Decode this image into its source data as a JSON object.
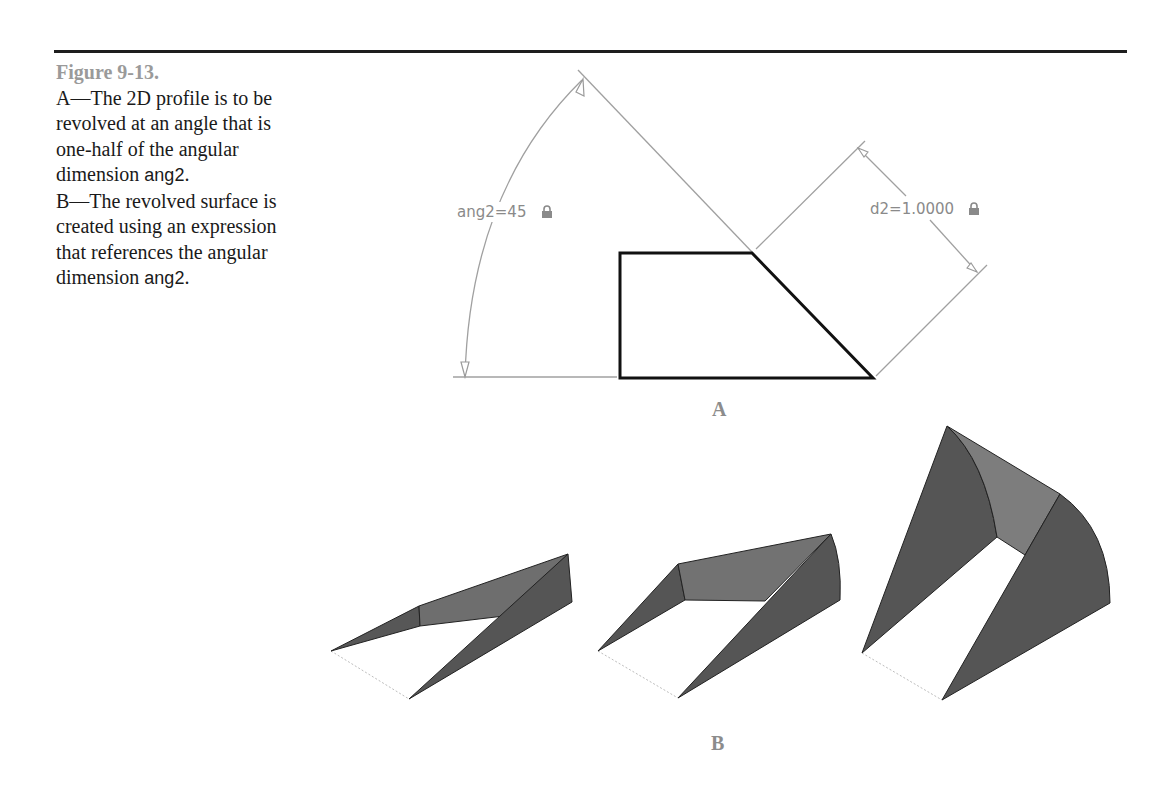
{
  "figure": {
    "number": "Figure 9-13.",
    "caption_parts": {
      "a_text": "A—The 2D profile is to be revolved at an angle that is one-half of the angular dimension ",
      "a_code": "ang2",
      "a_end": ".",
      "b_text": "B—The revolved surface is created using an expression that references the angular dimension ",
      "b_code": "ang2",
      "b_end": "."
    }
  },
  "panel_a": {
    "label": "A",
    "angular_dimension": "ang2=45",
    "linear_dimension": "d2=1.0000",
    "lock_icon": "lock-icon"
  },
  "panel_b": {
    "label": "B",
    "shapes": [
      "revolved-surface-small",
      "revolved-surface-medium",
      "revolved-surface-large"
    ]
  },
  "colors": {
    "rule": "#1e1e1e",
    "profile": "#111111",
    "dimension": "#9a9a9a",
    "surface_dark": "#555555",
    "surface_light": "#7d7d7d",
    "caption_heading": "#9a9a9a"
  }
}
